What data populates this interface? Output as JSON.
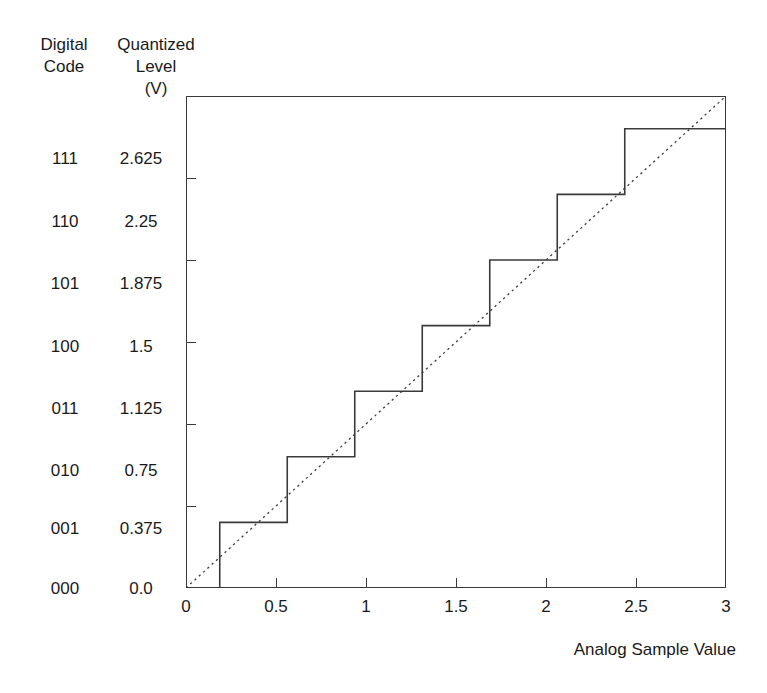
{
  "headers": {
    "digital_code": "Digital\nCode",
    "quantized_level": "Quantized\nLevel\n(V)"
  },
  "rows": [
    {
      "code": "111",
      "level": "2.625"
    },
    {
      "code": "110",
      "level": "2.25"
    },
    {
      "code": "101",
      "level": "1.875"
    },
    {
      "code": "100",
      "level": "1.5"
    },
    {
      "code": "011",
      "level": "1.125"
    },
    {
      "code": "010",
      "level": "0.75"
    },
    {
      "code": "001",
      "level": "0.375"
    },
    {
      "code": "000",
      "level": "0.0"
    }
  ],
  "xaxis": {
    "title": "Analog Sample Value",
    "ticks": [
      "0",
      "0.5",
      "1",
      "1.5",
      "2",
      "2.5",
      "3"
    ]
  },
  "colors": {
    "axis": "#3a3a3a",
    "staircase": "#3a3a3a",
    "ideal_line": "#3a3a3a",
    "background": "#ffffff",
    "text": "#1a1a1a"
  },
  "chart_data": {
    "type": "line",
    "title": "",
    "xlabel": "Analog Sample Value",
    "ylabel": "Quantized Level (V)",
    "xlim": [
      0,
      3
    ],
    "ylim": [
      0,
      2.8125
    ],
    "grid": false,
    "legend": "none",
    "xticks": [
      0,
      0.5,
      1,
      1.5,
      2,
      2.5,
      3
    ],
    "yticks": [
      0.0,
      0.375,
      0.75,
      1.125,
      1.5,
      1.875,
      2.25,
      2.625
    ],
    "ytick_labels": [
      "0.0",
      "0.375",
      "0.75",
      "1.125",
      "1.5",
      "1.875",
      "2.25",
      "2.625"
    ],
    "ytick_codes": [
      "000",
      "001",
      "010",
      "011",
      "100",
      "101",
      "110",
      "111"
    ],
    "series": [
      {
        "name": "Quantizer transfer (staircase)",
        "style": "solid",
        "type": "step",
        "step_edges": [
          0.1875,
          0.5625,
          0.9375,
          1.3125,
          1.6875,
          2.0625,
          2.4375
        ],
        "levels": [
          0.0,
          0.375,
          0.75,
          1.125,
          1.5,
          1.875,
          2.25,
          2.625
        ],
        "x": [
          0,
          0.1875,
          0.1875,
          0.5625,
          0.5625,
          0.9375,
          0.9375,
          1.3125,
          1.3125,
          1.6875,
          1.6875,
          2.0625,
          2.0625,
          2.4375,
          2.4375,
          3
        ],
        "y": [
          0,
          0,
          0.375,
          0.375,
          0.75,
          0.75,
          1.125,
          1.125,
          1.5,
          1.5,
          1.875,
          1.875,
          2.25,
          2.25,
          2.625,
          2.625
        ]
      },
      {
        "name": "Ideal analog (dotted)",
        "style": "dotted",
        "type": "line",
        "x": [
          0,
          3
        ],
        "y": [
          0,
          2.8125
        ]
      }
    ]
  }
}
